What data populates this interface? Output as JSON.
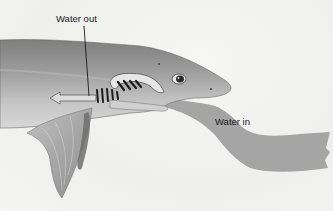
{
  "diagram": {
    "labels": {
      "water_out": "Water out",
      "water_in": "Water in"
    },
    "colors": {
      "background": "#f4f4f2",
      "body_dark": "#8a8a8a",
      "body_light": "#c8c8c8",
      "water_stream": "#9a9a9a",
      "gill_slits": "#1e1e1e",
      "text": "#1a1a1a"
    }
  }
}
